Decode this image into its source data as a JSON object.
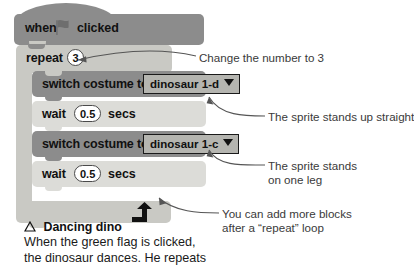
{
  "page": {
    "background": "#ffffff",
    "block_dark": "#8c8c8c",
    "block_light": "#dcdcd8",
    "c_block": "#c9c9c4",
    "text_color": "#111111",
    "anno_color": "#3a3a3a"
  },
  "script": {
    "hat": {
      "word_when": "when",
      "flag_icon": "green-flag-icon",
      "word_clicked": "clicked"
    },
    "repeat": {
      "label": "repeat",
      "times": "3",
      "loop_icon": "loop-arrow-icon"
    },
    "blocks": [
      {
        "type": "switch-costume",
        "label": "switch costume to",
        "dropdown_value": "dinosaur 1-d",
        "dropdown_icon": "chevron-down-icon"
      },
      {
        "type": "wait",
        "label": "wait",
        "value": "0.5",
        "tail": "secs"
      },
      {
        "type": "switch-costume",
        "label": "switch costume to",
        "dropdown_value": "dinosaur 1-c",
        "dropdown_icon": "chevron-down-icon"
      },
      {
        "type": "wait",
        "label": "wait",
        "value": "0.5",
        "tail": "secs"
      }
    ]
  },
  "annotations": [
    {
      "id": "change-number",
      "text": "Change the number to 3"
    },
    {
      "id": "stands-up-straight",
      "text": "The sprite stands up straight"
    },
    {
      "id": "stands-one-leg",
      "text": "The sprite stands\non one leg"
    },
    {
      "id": "add-more-blocks",
      "text": "You can add more blocks\nafter a “repeat” loop"
    }
  ],
  "caption": {
    "bullet_icon": "triangle-bullet-icon",
    "heading": "Dancing dino",
    "body": "When the green flag is clicked,\nthe dinosaur dances. He repeats"
  }
}
